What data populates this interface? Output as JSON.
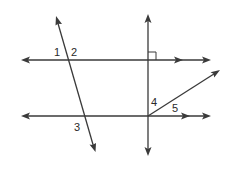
{
  "diagram": {
    "colors": {
      "stroke": "#3a3a3a",
      "text": "#2a2a2a",
      "background": "#ffffff"
    },
    "lines": [
      {
        "id": "parallel-line-top",
        "kind": "line",
        "parallel_marker": "double-arrow"
      },
      {
        "id": "parallel-line-bottom",
        "kind": "line",
        "parallel_marker": "double-arrow"
      },
      {
        "id": "vertical-line",
        "kind": "line",
        "perpendicular_to": "parallel-line-top"
      },
      {
        "id": "transversal-line",
        "kind": "line"
      },
      {
        "id": "ray",
        "kind": "ray",
        "origin": "intersection of vertical-line and parallel-line-bottom"
      }
    ],
    "right_angle_marker": {
      "at": "intersection of vertical-line and parallel-line-top"
    },
    "angle_labels": {
      "a1": "1",
      "a2": "2",
      "a3": "3",
      "a4": "4",
      "a5": "5"
    }
  }
}
